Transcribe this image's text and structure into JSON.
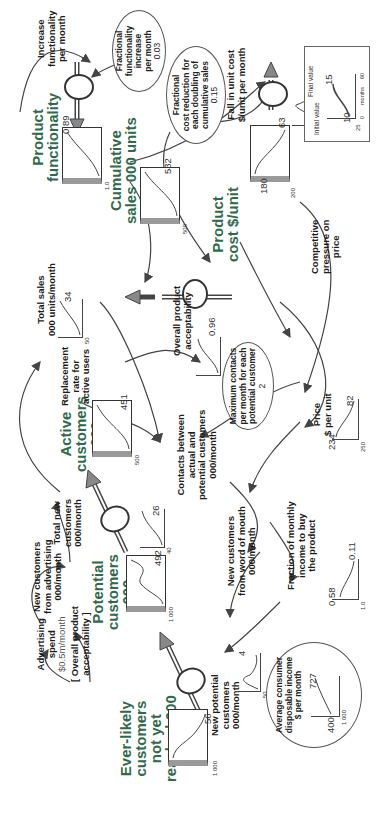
{
  "diagram": {
    "type": "stock-and-flow",
    "orientation": "rotated 90 degrees clockwise",
    "colors": {
      "stock_title": "#2f6b4b",
      "line": "#444444",
      "pipe_fill": "#888888",
      "box_side": "#9a9a9a"
    },
    "axis_common": {
      "x_start": "0",
      "x_end": "60",
      "x_label": "months"
    },
    "stocks": [
      {
        "id": "ever-likely",
        "title": [
          "Ever-likely",
          "customers",
          "not yet",
          "reached 000"
        ],
        "y_max": "1 000",
        "final_value": "56"
      },
      {
        "id": "potential",
        "title": [
          "Potential",
          "customers",
          "000"
        ],
        "y_max": "1 000",
        "final_value": "492"
      },
      {
        "id": "active",
        "title": [
          "Active",
          "customers",
          "000"
        ],
        "y_max": "500",
        "final_value": "451"
      },
      {
        "id": "cumulative-sales",
        "title": [
          "Cumulative",
          "sales 000 units"
        ],
        "y_max": "500",
        "final_value": "532"
      },
      {
        "id": "product-functionality",
        "title": [
          "Product",
          "functionality"
        ],
        "y_max": "1.0",
        "final_value": "0.89"
      },
      {
        "id": "product-cost",
        "title": [
          "Product",
          "cost $/unit"
        ],
        "y_max": "200",
        "initial_value": "180",
        "final_value": "63"
      }
    ],
    "flows": [
      {
        "id": "new-potential",
        "label": [
          "New potential",
          "customers",
          "000/month"
        ],
        "y_max": "50",
        "final_value": "4"
      },
      {
        "id": "total-new",
        "label": [
          "Total new",
          "customers",
          "000/month"
        ],
        "y_max": "40",
        "final_value": "26"
      },
      {
        "id": "total-sales",
        "label": [
          "Total sales",
          "000 units/month"
        ],
        "y_max": "50",
        "final_value": "34"
      },
      {
        "id": "increase-functionality",
        "label": [
          "Increase",
          "functionality",
          "per month"
        ]
      },
      {
        "id": "fall-unit-cost",
        "label": [
          "Fall in unit cost",
          "$/unit per month"
        ],
        "y_max": "10"
      }
    ],
    "auxiliaries": [
      {
        "id": "new-from-advertising",
        "label": [
          "New customers",
          "from advertising",
          "000/month"
        ]
      },
      {
        "id": "new-from-wom",
        "label": [
          "New customers",
          "from word of mouth",
          "000/month"
        ]
      },
      {
        "id": "contacts",
        "label": [
          "Contacts between",
          "actual and",
          "potential customers",
          "000/month"
        ]
      },
      {
        "id": "replacement",
        "label": [
          "Replacement",
          "rate for",
          "active users"
        ]
      },
      {
        "id": "overall-acceptability",
        "label": [
          "Overall product",
          "acceptability"
        ],
        "y_max": "1.0",
        "final_value": "0.96"
      },
      {
        "id": "price",
        "label": [
          "Price",
          "$ per unit"
        ],
        "y_max": "250",
        "initial_value": "234",
        "final_value": "82"
      },
      {
        "id": "fraction-income",
        "label": [
          "Fraction of monthly",
          "income to buy",
          "the product"
        ],
        "y_max": "1.0",
        "initial_value": "0.58",
        "final_value": "0.11"
      },
      {
        "id": "competitive-pressure",
        "label": [
          "Competitive",
          "pressure on",
          "price"
        ]
      },
      {
        "id": "advertising-spend",
        "label": [
          "Advertising",
          "spend"
        ],
        "value": "$0.5m/month"
      },
      {
        "id": "acceptability-ref",
        "label": [
          "[ Overall product",
          "acceptability ]"
        ]
      }
    ],
    "parameters": [
      {
        "id": "fractional-functionality",
        "label": [
          "Fractional",
          "functionality",
          "increase",
          "per month"
        ],
        "value": "0.03"
      },
      {
        "id": "fractional-cost-reduction",
        "label": [
          "Fractional",
          "cost reduction for",
          "each doubling of",
          "cumulative sales"
        ],
        "value": "0.15"
      },
      {
        "id": "max-contacts",
        "label": [
          "Maximum contacts",
          "per month for each",
          "potential customer"
        ],
        "value": "2"
      },
      {
        "id": "avg-income",
        "label": [
          "Average consumer",
          "disposable income",
          "$ per month"
        ],
        "y_max": "1 000",
        "initial_value": "400",
        "final_value": "727"
      }
    ],
    "legend": {
      "initial_label": "Initial value",
      "final_label": "Final value",
      "y_max": "25",
      "initial_value": "10",
      "final_value": "15",
      "x_start": "0",
      "x_end": "60",
      "x_label": "months"
    }
  }
}
